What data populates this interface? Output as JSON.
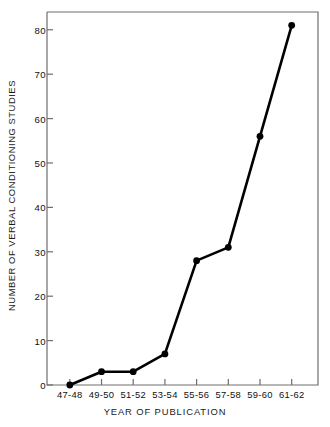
{
  "chart_data": {
    "type": "line",
    "title": "",
    "xlabel": "YEAR OF PUBLICATION",
    "ylabel": "NUMBER OF VERBAL CONDITIONING STUDIES",
    "categories": [
      "47-48",
      "49-50",
      "51-52",
      "53-54",
      "55-56",
      "57-58",
      "59-60",
      "61-62"
    ],
    "values": [
      0,
      3,
      3,
      7,
      28,
      31,
      56,
      81
    ],
    "series": [
      {
        "name": "Verbal conditioning studies",
        "values": [
          0,
          3,
          3,
          7,
          28,
          31,
          56,
          81
        ]
      }
    ],
    "ylim": [
      0,
      84
    ],
    "yticks": [
      0,
      10,
      20,
      30,
      40,
      50,
      60,
      70,
      80
    ],
    "ytick_labels": [
      "0",
      "10",
      "20",
      "30",
      "40",
      "50",
      "60",
      "70",
      "80"
    ],
    "grid": false,
    "legend": "none",
    "marker": "filled-circle",
    "line_color": "#000000",
    "marker_color": "#000000",
    "axis_color": "#6e6e6e",
    "background": "#ffffff"
  }
}
